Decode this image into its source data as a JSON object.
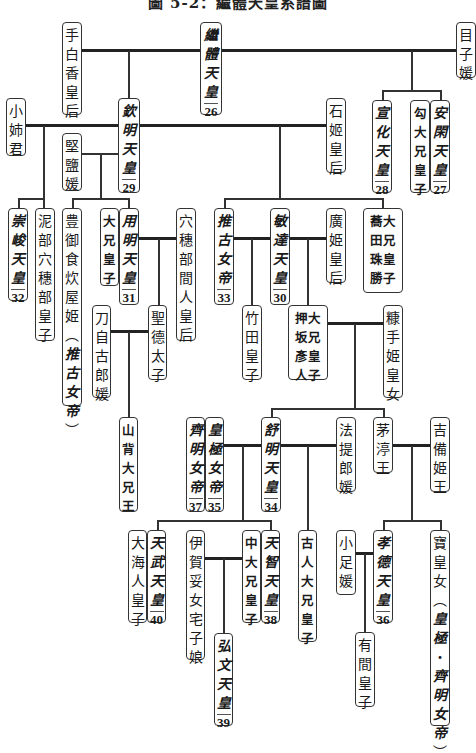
{
  "title": "圖 5-2：繼體天皇系譜圖",
  "persons": [
    {
      "id": "tashiraka",
      "chars": "手白香皇后",
      "x": 62,
      "y": 22,
      "w": 20,
      "h": 93
    },
    {
      "id": "keitai",
      "chars": "繼體天皇",
      "num": "26",
      "emperor": true,
      "x": 200,
      "y": 22,
      "w": 22,
      "h": 93
    },
    {
      "id": "menoko",
      "chars": "目子媛",
      "x": 456,
      "y": 22,
      "w": 20,
      "h": 56
    },
    {
      "id": "ankan",
      "chars": "安閑天皇",
      "num": "27",
      "emperor": true,
      "x": 430,
      "y": 100,
      "w": 20,
      "h": 93
    },
    {
      "id": "magari",
      "chars": "勾大兄皇子",
      "bold": true,
      "x": 410,
      "y": 100,
      "w": 20,
      "h": 93
    },
    {
      "id": "senka",
      "chars": "宣化天皇",
      "num": "28",
      "emperor": true,
      "x": 372,
      "y": 100,
      "w": 20,
      "h": 93
    },
    {
      "id": "ishihime",
      "chars": "石姬皇后",
      "x": 326,
      "y": 98,
      "w": 20,
      "h": 75
    },
    {
      "id": "kinmei",
      "chars": "欽明天皇",
      "num": "29",
      "emperor": true,
      "x": 118,
      "y": 98,
      "w": 22,
      "h": 95
    },
    {
      "id": "oane",
      "chars": "小姉君",
      "x": 6,
      "y": 98,
      "w": 20,
      "h": 58
    },
    {
      "id": "kitashi",
      "chars": "堅鹽媛",
      "x": 62,
      "y": 133,
      "w": 20,
      "h": 58
    },
    {
      "id": "sushun",
      "chars": "崇峻天皇",
      "num": "32",
      "emperor": true,
      "x": 8,
      "y": 208,
      "w": 20,
      "h": 93
    },
    {
      "id": "hasetsukabe",
      "chars": "泥部穴穗部皇子",
      "x": 35,
      "y": 208,
      "w": 20,
      "h": 133
    },
    {
      "id": "toyomike",
      "chars": "豊御食炊屋姫（推古女帝）",
      "mixed": [
        0,
        6,
        7,
        12
      ],
      "x": 62,
      "y": 208,
      "w": 20,
      "h": 198
    },
    {
      "id": "ooe1",
      "chars": "大兄皇子",
      "bold": true,
      "x": 100,
      "y": 208,
      "w": 19,
      "h": 78
    },
    {
      "id": "yomei",
      "chars": "用明天皇",
      "num": "31",
      "emperor": true,
      "x": 119,
      "y": 208,
      "w": 20,
      "h": 97
    },
    {
      "id": "anahobe",
      "chars": "穴穗部間人皇后",
      "x": 176,
      "y": 208,
      "w": 20,
      "h": 133
    },
    {
      "id": "tojiko",
      "chars": "刀自古郎媛",
      "x": 92,
      "y": 305,
      "w": 19,
      "h": 93
    },
    {
      "id": "shotoku",
      "chars": "聖德太子",
      "x": 148,
      "y": 305,
      "w": 19,
      "h": 75
    },
    {
      "id": "suiko",
      "chars": "推古女帝",
      "num": "33",
      "emperor": true,
      "x": 214,
      "y": 208,
      "w": 20,
      "h": 97
    },
    {
      "id": "bidatsu",
      "chars": "敏達天皇",
      "num": "30",
      "emperor": true,
      "x": 270,
      "y": 208,
      "w": 20,
      "h": 97
    },
    {
      "id": "hirohime",
      "chars": "廣姫皇后",
      "x": 326,
      "y": 208,
      "w": 20,
      "h": 75
    },
    {
      "id": "nunakura",
      "chars": "大兄皇子蕎田珠勝",
      "bold": true,
      "twoCol": [
        "大兄皇子",
        "蕎田珠勝"
      ],
      "x": 363,
      "y": 208,
      "w": 40,
      "h": 85
    },
    {
      "id": "takeda",
      "chars": "竹田皇子",
      "x": 242,
      "y": 305,
      "w": 20,
      "h": 75
    },
    {
      "id": "oshisaka",
      "chars": "大兄皇子押坂彥人",
      "bold": true,
      "twoCol": [
        "大兄皇子",
        "押坂彥人"
      ],
      "x": 288,
      "y": 305,
      "w": 40,
      "h": 75
    },
    {
      "id": "nukate",
      "chars": "糠手姫皇女",
      "x": 383,
      "y": 305,
      "w": 20,
      "h": 93
    },
    {
      "id": "yamashiro",
      "chars": "山背大兄王",
      "bold": true,
      "x": 119,
      "y": 417,
      "w": 19,
      "h": 95
    },
    {
      "id": "saimei",
      "chars": "齊明女帝",
      "num": "37",
      "emperor": true,
      "x": 186,
      "y": 417,
      "w": 19,
      "h": 95
    },
    {
      "id": "kogyoku",
      "chars": "皇極女帝",
      "num": "35",
      "emperor": true,
      "x": 205,
      "y": 417,
      "w": 19,
      "h": 95
    },
    {
      "id": "jomei",
      "chars": "舒明天皇",
      "num": "34",
      "emperor": true,
      "x": 261,
      "y": 417,
      "w": 20,
      "h": 95
    },
    {
      "id": "hote",
      "chars": "法提郎媛",
      "x": 336,
      "y": 417,
      "w": 20,
      "h": 75
    },
    {
      "id": "chinu",
      "chars": "茅渟王",
      "x": 373,
      "y": 417,
      "w": 20,
      "h": 56
    },
    {
      "id": "kibi",
      "chars": "吉備姫王",
      "x": 430,
      "y": 417,
      "w": 20,
      "h": 75
    },
    {
      "id": "oama",
      "chars": "大海人皇子",
      "x": 128,
      "y": 530,
      "w": 19,
      "h": 93
    },
    {
      "id": "tenmu",
      "chars": "天武天皇",
      "num": "40",
      "emperor": true,
      "x": 147,
      "y": 530,
      "w": 19,
      "h": 93
    },
    {
      "id": "yakako",
      "chars": "伊賀宅子娘",
      "fullLabel": "伊賀妥女宅子娘",
      "x": 186,
      "y": 530,
      "w": 19,
      "h": 130
    },
    {
      "id": "nakano",
      "chars": "中大兄皇子",
      "bold": true,
      "x": 242,
      "y": 530,
      "w": 19,
      "h": 93
    },
    {
      "id": "tenji",
      "chars": "天智天皇",
      "num": "38",
      "emperor": true,
      "x": 261,
      "y": 530,
      "w": 19,
      "h": 93
    },
    {
      "id": "kobun",
      "chars": "弘文天皇",
      "num": "39",
      "emperor": true,
      "x": 214,
      "y": 633,
      "w": 19,
      "h": 93
    },
    {
      "id": "furuhito",
      "chars": "古人大兄皇子",
      "bold": true,
      "x": 298,
      "y": 530,
      "w": 19,
      "h": 112
    },
    {
      "id": "oashi",
      "chars": "小足媛",
      "x": 336,
      "y": 530,
      "w": 20,
      "h": 65
    },
    {
      "id": "kotoku",
      "chars": "孝德天皇",
      "num": "36",
      "emperor": true,
      "x": 373,
      "y": 530,
      "w": 20,
      "h": 93
    },
    {
      "id": "arima",
      "chars": "有間皇子",
      "x": 355,
      "y": 632,
      "w": 20,
      "h": 75
    },
    {
      "id": "takara",
      "chars": "寶皇女（皇極・齊明女帝）",
      "mixed": [
        0,
        3,
        4,
        11
      ],
      "x": 430,
      "y": 530,
      "w": 20,
      "h": 196
    }
  ],
  "labels": {
    "tashiraka": "手白香皇后",
    "keitai": "繼體天皇",
    "menoko": "目子媛",
    "ankan": "安閑天皇",
    "magari": "勾大兄皇子",
    "senka": "宣化天皇",
    "ishihime": "石姬皇后",
    "kinmei": "欽明天皇",
    "oane": "小姉君",
    "kitashi": "堅鹽媛",
    "sushun": "崇峻天皇",
    "hasetsukabe": "泥部穴穗部皇子",
    "toyomike": "豊御食炊屋姫（推古女帝）",
    "ooe1": "大兄皇子",
    "yomei": "用明天皇",
    "anahobe": "穴穗部間人皇后",
    "tojiko": "刀自古郎媛",
    "shotoku": "聖德太子",
    "suiko": "推古女帝",
    "bidatsu": "敏達天皇",
    "hirohime": "廣姫皇后",
    "nunakura_a": "大兄皇子",
    "nunakura_b": "蕎田珠勝",
    "takeda": "竹田皇子",
    "oshisaka_a": "大兄皇子",
    "oshisaka_b": "押坂彥人",
    "nukate": "糠手姫皇女",
    "yamashiro": "山背大兄王",
    "saimei": "齊明女帝",
    "kogyoku": "皇極女帝",
    "jomei": "舒明天皇",
    "hote": "法提郎媛",
    "chinu": "茅渟王",
    "kibi": "吉備姫王",
    "oama": "大海人皇子",
    "tenmu": "天武天皇",
    "yakako": "伊賀妥女宅子娘",
    "nakano": "中大兄皇子",
    "tenji": "天智天皇",
    "kobun": "弘文天皇",
    "furuhito": "古人大兄皇子",
    "oashi": "小足媛",
    "kotoku": "孝德天皇",
    "arima": "有間皇子",
    "takara": "寶皇女（皇極・齊明女帝）"
  },
  "numbers": {
    "keitai": "26",
    "ankan": "27",
    "senka": "28",
    "kinmei": "29",
    "bidatsu": "30",
    "yomei": "31",
    "sushun": "32",
    "suiko": "33",
    "jomei": "34",
    "kogyoku": "35",
    "kotoku": "36",
    "saimei": "37",
    "tenji": "38",
    "kobun": "39",
    "tenmu": "40"
  },
  "lines": [
    {
      "t": "h",
      "x": 82,
      "y": 50,
      "w": 118,
      "thick": true
    },
    {
      "t": "h",
      "x": 222,
      "y": 50,
      "w": 234,
      "thick": true
    },
    {
      "t": "v",
      "x": 128,
      "y": 51,
      "h": 47
    },
    {
      "t": "v",
      "x": 411,
      "y": 51,
      "h": 40
    },
    {
      "t": "h",
      "x": 382,
      "y": 90,
      "w": 59,
      "thin": true
    },
    {
      "t": "v",
      "x": 382,
      "y": 90,
      "h": 10
    },
    {
      "t": "v",
      "x": 440,
      "y": 90,
      "h": 10
    },
    {
      "t": "h",
      "x": 26,
      "y": 125,
      "w": 92,
      "thick": true
    },
    {
      "t": "h",
      "x": 140,
      "y": 125,
      "w": 186,
      "thick": true
    },
    {
      "t": "v",
      "x": 43,
      "y": 126,
      "h": 72
    },
    {
      "t": "h",
      "x": 18,
      "y": 198,
      "w": 26,
      "thin": true
    },
    {
      "t": "v",
      "x": 18,
      "y": 198,
      "h": 10
    },
    {
      "t": "v",
      "x": 43,
      "y": 198,
      "h": 10
    },
    {
      "t": "h",
      "x": 82,
      "y": 153,
      "w": 36,
      "thin": true
    },
    {
      "t": "v",
      "x": 100,
      "y": 154,
      "h": 44
    },
    {
      "t": "h",
      "x": 72,
      "y": 198,
      "w": 57,
      "thin": true
    },
    {
      "t": "v",
      "x": 72,
      "y": 198,
      "h": 10
    },
    {
      "t": "v",
      "x": 128,
      "y": 198,
      "h": 10
    },
    {
      "t": "v",
      "x": 279,
      "y": 126,
      "h": 72
    },
    {
      "t": "h",
      "x": 224,
      "y": 198,
      "w": 159,
      "thin": true
    },
    {
      "t": "v",
      "x": 224,
      "y": 198,
      "h": 10
    },
    {
      "t": "v",
      "x": 382,
      "y": 198,
      "h": 10
    },
    {
      "t": "h",
      "x": 139,
      "y": 238,
      "w": 37,
      "thick": true
    },
    {
      "t": "v",
      "x": 158,
      "y": 239,
      "h": 66
    },
    {
      "t": "h",
      "x": 111,
      "y": 331,
      "w": 37,
      "thick": true
    },
    {
      "t": "v",
      "x": 128,
      "y": 332,
      "h": 85
    },
    {
      "t": "h",
      "x": 234,
      "y": 238,
      "w": 36,
      "thick": true
    },
    {
      "t": "v",
      "x": 251,
      "y": 239,
      "h": 66
    },
    {
      "t": "h",
      "x": 290,
      "y": 238,
      "w": 36,
      "thick": true
    },
    {
      "t": "v",
      "x": 307,
      "y": 239,
      "h": 66
    },
    {
      "t": "h",
      "x": 328,
      "y": 323,
      "w": 55,
      "thick": true
    },
    {
      "t": "v",
      "x": 354,
      "y": 324,
      "h": 84
    },
    {
      "t": "h",
      "x": 271,
      "y": 408,
      "w": 112,
      "thin": true
    },
    {
      "t": "v",
      "x": 271,
      "y": 408,
      "h": 9
    },
    {
      "t": "v",
      "x": 383,
      "y": 408,
      "h": 9
    },
    {
      "t": "h",
      "x": 224,
      "y": 445,
      "w": 37,
      "thick": true
    },
    {
      "t": "v",
      "x": 242,
      "y": 446,
      "h": 74
    },
    {
      "t": "h",
      "x": 157,
      "y": 520,
      "w": 114,
      "thin": true
    },
    {
      "t": "v",
      "x": 157,
      "y": 520,
      "h": 10
    },
    {
      "t": "v",
      "x": 270,
      "y": 520,
      "h": 10
    },
    {
      "t": "h",
      "x": 281,
      "y": 445,
      "w": 55,
      "thick": true
    },
    {
      "t": "v",
      "x": 307,
      "y": 446,
      "h": 84
    },
    {
      "t": "h",
      "x": 393,
      "y": 445,
      "w": 37,
      "thick": true
    },
    {
      "t": "v",
      "x": 411,
      "y": 446,
      "h": 74
    },
    {
      "t": "h",
      "x": 383,
      "y": 520,
      "w": 57,
      "thin": true
    },
    {
      "t": "v",
      "x": 383,
      "y": 520,
      "h": 10
    },
    {
      "t": "v",
      "x": 440,
      "y": 520,
      "h": 10
    },
    {
      "t": "h",
      "x": 205,
      "y": 558,
      "w": 37,
      "thick": true
    },
    {
      "t": "v",
      "x": 223,
      "y": 559,
      "h": 74
    },
    {
      "t": "h",
      "x": 356,
      "y": 553,
      "w": 17,
      "thick": true
    },
    {
      "t": "v",
      "x": 364,
      "y": 554,
      "h": 78
    }
  ]
}
